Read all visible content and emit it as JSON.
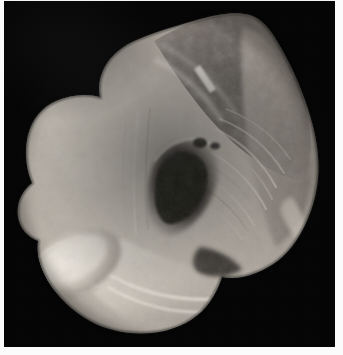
{
  "page": {
    "background_color": "#ffffff",
    "width": 343,
    "height": 355,
    "margin_color": "#fbfbfb",
    "caption": ""
  },
  "plate": {
    "name": "anatomical-specimen-photograph",
    "background_color": "#050505",
    "x": 4,
    "y": 1,
    "width": 331,
    "height": 346,
    "color_mode": "grayscale",
    "subject": "dissected cadaveric pelvic half-specimen",
    "orientation": "oblique medial view",
    "label_text": "",
    "scale_bar_text": ""
  },
  "specimen": {
    "name": "pelvic-dissection-specimen",
    "tone_range": {
      "highlight": "#e8e4dc",
      "light": "#cfc9bf",
      "midtone": "#9a9289",
      "shadow": "#5e5852",
      "deep_shadow": "#221f1c"
    },
    "regions": [
      {
        "id": "iliac-blade",
        "label": "",
        "description": "broad pale bone blade occupying upper left",
        "tone": "#cbc5ba"
      },
      {
        "id": "sacro-iliac-field",
        "label": "",
        "description": "darker mottled tissue field across upper center-right",
        "tone": "#7d7670"
      },
      {
        "id": "acetabular-fossa",
        "label": "",
        "description": "deep dark concavity at center",
        "tone": "#2a2623"
      },
      {
        "id": "ischial-ramus",
        "label": "",
        "description": "pale curved ridge sweeping to lower right",
        "tone": "#ddd7cc"
      },
      {
        "id": "pubic-body",
        "label": "",
        "description": "rounded bright ovoid mass at lower left",
        "tone": "#e2ddd3"
      },
      {
        "id": "ligament-striations",
        "label": "",
        "description": "fine parallel fibrous striations radiating right of fossa",
        "tone": "#b4ada3"
      }
    ]
  },
  "annotations": {
    "arrows": [],
    "leader_lines": [],
    "letters": [],
    "numbers": []
  }
}
